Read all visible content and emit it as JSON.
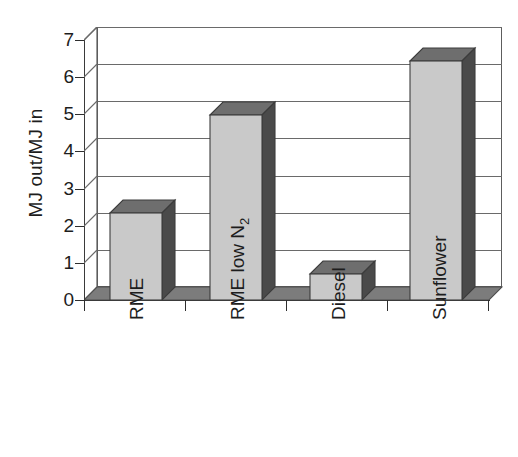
{
  "chart_data": {
    "type": "bar",
    "title": "",
    "subtitle": "",
    "xlabel": "",
    "ylabel": "MJ out/MJ in",
    "categories": [
      "RME",
      "RME low N2",
      "Diesel",
      "Sunflower"
    ],
    "category_labels_html": [
      "RME",
      "RME low N<sub>2</sub>",
      "Diesel",
      "Sunflower"
    ],
    "values": [
      2.15,
      4.65,
      0.7,
      6.1
    ],
    "ylim": [
      0,
      7
    ],
    "ytick_labels": [
      "0",
      "1",
      "2",
      "3",
      "4",
      "5",
      "6",
      "7"
    ],
    "ytick_values": [
      0,
      1,
      2,
      3,
      4,
      5,
      6,
      7
    ],
    "grid": "horizontal",
    "legend": "none",
    "style": "3d-column",
    "colors": {
      "bar_front": "#c9c9c9",
      "bar_side": "#4a4a4a",
      "bar_top": "#6e6e6e",
      "floor": "#7c7c7c",
      "plot_background": "#ffffff",
      "gridline": "#6a6a6a",
      "axis": "#3a3a3a",
      "text": "#1d1d1d"
    }
  },
  "axis": {
    "y_title": "MJ out/MJ in"
  }
}
